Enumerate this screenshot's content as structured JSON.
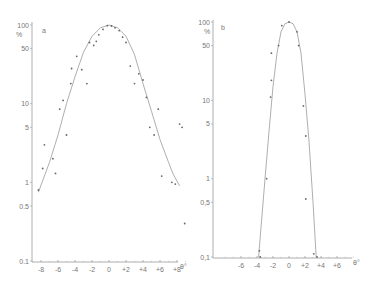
{
  "chart_data": [
    {
      "type": "scatter",
      "panel_label": "a",
      "title": "",
      "xlabel": "θ°",
      "ylabel": "%",
      "yscale": "log",
      "ylim": [
        0.1,
        100
      ],
      "xlim": [
        -9,
        9
      ],
      "x_ticks": [
        "-8",
        "-6",
        "-4",
        "-2",
        "0",
        "+2",
        "+4",
        "+6",
        "+8"
      ],
      "y_ticks": [
        "100",
        "50",
        "10",
        "5",
        "1",
        "0.5",
        "0.1"
      ],
      "grid": false,
      "series": [
        {
          "name": "measured points",
          "points": [
            {
              "x": -8.3,
              "y": 0.8
            },
            {
              "x": -7.8,
              "y": 1.5
            },
            {
              "x": -7.6,
              "y": 3.0
            },
            {
              "x": -6.6,
              "y": 2.0
            },
            {
              "x": -6.3,
              "y": 1.3
            },
            {
              "x": -5.8,
              "y": 8.5
            },
            {
              "x": -5.4,
              "y": 11
            },
            {
              "x": -5.0,
              "y": 4.0
            },
            {
              "x": -4.5,
              "y": 18
            },
            {
              "x": -4.4,
              "y": 28
            },
            {
              "x": -3.8,
              "y": 40
            },
            {
              "x": -3.2,
              "y": 27
            },
            {
              "x": -2.6,
              "y": 18
            },
            {
              "x": -2.3,
              "y": 60
            },
            {
              "x": -1.8,
              "y": 55
            },
            {
              "x": -1.5,
              "y": 62
            },
            {
              "x": -1.2,
              "y": 75
            },
            {
              "x": -0.7,
              "y": 88
            },
            {
              "x": -0.2,
              "y": 98
            },
            {
              "x": 0.3,
              "y": 97
            },
            {
              "x": 0.7,
              "y": 92
            },
            {
              "x": 1.2,
              "y": 85
            },
            {
              "x": 1.6,
              "y": 70
            },
            {
              "x": 2.0,
              "y": 60
            },
            {
              "x": 2.5,
              "y": 30
            },
            {
              "x": 3.0,
              "y": 18
            },
            {
              "x": 3.5,
              "y": 24
            },
            {
              "x": 4.0,
              "y": 20
            },
            {
              "x": 4.4,
              "y": 12
            },
            {
              "x": 4.8,
              "y": 5.0
            },
            {
              "x": 5.3,
              "y": 4.0
            },
            {
              "x": 5.8,
              "y": 8.5
            },
            {
              "x": 6.2,
              "y": 1.2
            },
            {
              "x": 7.4,
              "y": 1.0
            },
            {
              "x": 7.8,
              "y": 0.95
            },
            {
              "x": 8.3,
              "y": 5.5
            },
            {
              "x": 8.6,
              "y": 5.0
            },
            {
              "x": 8.9,
              "y": 0.3
            }
          ]
        },
        {
          "name": "fitted curve",
          "points": [
            {
              "x": -8.3,
              "y": 0.75
            },
            {
              "x": -7,
              "y": 1.8
            },
            {
              "x": -6,
              "y": 4.0
            },
            {
              "x": -5,
              "y": 10
            },
            {
              "x": -4,
              "y": 22
            },
            {
              "x": -3,
              "y": 45
            },
            {
              "x": -2,
              "y": 72
            },
            {
              "x": -1,
              "y": 92
            },
            {
              "x": 0,
              "y": 100
            },
            {
              "x": 1,
              "y": 92
            },
            {
              "x": 2,
              "y": 72
            },
            {
              "x": 3,
              "y": 42
            },
            {
              "x": 4,
              "y": 18
            },
            {
              "x": 5,
              "y": 8
            },
            {
              "x": 6,
              "y": 3.5
            },
            {
              "x": 7,
              "y": 1.8
            },
            {
              "x": 7.5,
              "y": 1.3
            },
            {
              "x": 8.3,
              "y": 0.9
            }
          ]
        }
      ]
    },
    {
      "type": "scatter",
      "panel_label": "b",
      "title": "",
      "xlabel": "θ°",
      "ylabel": "%",
      "yscale": "log",
      "ylim": [
        0.1,
        100
      ],
      "xlim": [
        -8,
        8
      ],
      "x_ticks": [
        "-6",
        "-4",
        "-2",
        "0",
        "+2",
        "+4",
        "+6"
      ],
      "y_ticks": [
        "100",
        "50",
        "10",
        "5",
        "1",
        "0,5",
        "0,1"
      ],
      "grid": false,
      "series": [
        {
          "name": "measured points",
          "points": [
            {
              "x": -3.7,
              "y": 0.12
            },
            {
              "x": -3.6,
              "y": 0.1
            },
            {
              "x": -2.8,
              "y": 1.0
            },
            {
              "x": -2.3,
              "y": 11
            },
            {
              "x": -2.2,
              "y": 18
            },
            {
              "x": -2.2,
              "y": 40
            },
            {
              "x": -1.3,
              "y": 50
            },
            {
              "x": -0.9,
              "y": 90
            },
            {
              "x": 0.0,
              "y": 100
            },
            {
              "x": 1.0,
              "y": 75
            },
            {
              "x": 1.2,
              "y": 50
            },
            {
              "x": 1.8,
              "y": 8.5
            },
            {
              "x": 2.1,
              "y": 3.5
            },
            {
              "x": 2.1,
              "y": 0.55
            },
            {
              "x": 3.1,
              "y": 0.11
            },
            {
              "x": 3.5,
              "y": 0.1
            }
          ]
        },
        {
          "name": "fitted curve",
          "points": [
            {
              "x": -3.8,
              "y": 0.1
            },
            {
              "x": -3,
              "y": 1.0
            },
            {
              "x": -2.5,
              "y": 4
            },
            {
              "x": -2,
              "y": 15
            },
            {
              "x": -1.5,
              "y": 40
            },
            {
              "x": -1,
              "y": 75
            },
            {
              "x": -0.5,
              "y": 95
            },
            {
              "x": 0,
              "y": 100
            },
            {
              "x": 0.5,
              "y": 95
            },
            {
              "x": 1,
              "y": 75
            },
            {
              "x": 1.5,
              "y": 40
            },
            {
              "x": 2,
              "y": 12
            },
            {
              "x": 2.5,
              "y": 3
            },
            {
              "x": 3,
              "y": 0.5
            },
            {
              "x": 3.4,
              "y": 0.1
            }
          ]
        }
      ]
    }
  ],
  "panels": {
    "a": {
      "label": "a",
      "unit": "%",
      "xlabel": "θ°",
      "y_ticks": [
        "100",
        "50",
        "10",
        "5",
        "1",
        "0.5",
        "0.1"
      ],
      "x_ticks": [
        "-8",
        "-6",
        "-4",
        "-2",
        "0",
        "+2",
        "+4",
        "+6",
        "+8"
      ]
    },
    "b": {
      "label": "b",
      "unit": "%",
      "xlabel": "θ°",
      "y_ticks": [
        "100",
        "50",
        "10",
        "5",
        "1",
        "0,5",
        "0,1"
      ],
      "x_ticks": [
        "-6",
        "-4",
        "-2",
        "0",
        "+2",
        "+4",
        "+6"
      ]
    }
  },
  "colors": {
    "ink": "#777777",
    "points": "#666666",
    "curve": "#999999",
    "background": "#ffffff"
  }
}
